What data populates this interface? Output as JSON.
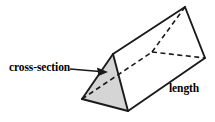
{
  "figure": {
    "name": "triangular-prism-diagram",
    "background_color": "#ffffff",
    "stroke_color": "#1a1a1a",
    "shaded_face_color": "#d5d5d5",
    "labels": {
      "cross_section": "cross-section",
      "length": "length"
    },
    "geometry": {
      "description": "Oblique view of a triangular prism lying on its rectangular face, near triangular end shaded grey.",
      "near_triangle": {
        "apex": [
          113,
          54
        ],
        "bottom_left": [
          82,
          99
        ],
        "bottom_right": [
          128,
          111
        ],
        "filled": true
      },
      "far_triangle": {
        "apex": [
          185,
          7
        ],
        "hidden_back": [
          152,
          52
        ],
        "bottom_right": [
          205,
          58
        ],
        "filled": false
      },
      "visible_edges": [
        [
          [
            113,
            54
          ],
          [
            185,
            7
          ]
        ],
        [
          [
            128,
            111
          ],
          [
            205,
            58
          ]
        ],
        [
          [
            82,
            99
          ],
          [
            128,
            111
          ]
        ],
        [
          [
            113,
            54
          ],
          [
            82,
            99
          ]
        ],
        [
          [
            113,
            54
          ],
          [
            128,
            111
          ]
        ],
        [
          [
            185,
            7
          ],
          [
            205,
            58
          ]
        ]
      ],
      "hidden_edges": [
        [
          [
            82,
            99
          ],
          [
            152,
            52
          ]
        ],
        [
          [
            152,
            52
          ],
          [
            185,
            7
          ]
        ],
        [
          [
            152,
            52
          ],
          [
            205,
            58
          ]
        ]
      ],
      "pointer_arrow": {
        "from": [
          78,
          70
        ],
        "to": [
          106,
          72
        ],
        "target": "near_triangle_shaded_face"
      }
    }
  }
}
